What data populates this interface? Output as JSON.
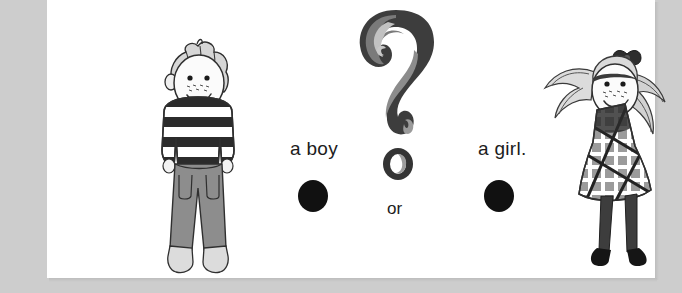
{
  "page": {
    "background_color": "#cdcdcd",
    "card_color": "#ffffff",
    "kind": "worksheet-question-illustration"
  },
  "question": {
    "mark_glyph": "?",
    "mark_label": "stylized-question-mark",
    "mark_colors": {
      "dark": "#3a3a3a",
      "mid": "#6e6e6e",
      "light": "#9a9a9a",
      "highlight": "#cfcfcf"
    }
  },
  "choices": [
    {
      "id": "boy",
      "label": "a boy",
      "bubble": "answer-bubble",
      "bubble_color": "#111111",
      "illustration": "boy-figure"
    },
    {
      "id": "girl",
      "label": "a girl.",
      "bubble": "answer-bubble",
      "bubble_color": "#111111",
      "illustration": "girl-figure"
    }
  ],
  "connector": {
    "label": "or"
  },
  "illustrations": {
    "boy": {
      "name": "boy-figure",
      "hair": "spiky-short-hair",
      "shirt": "horizontal-striped-sweater",
      "shirt_colors": [
        "#2b2b2b",
        "#ffffff"
      ],
      "pants": "long-gray-pants",
      "pants_color": "#8d8d8d",
      "shoes": "light-gray-shoes",
      "shoes_color": "#d8d8d8",
      "face": "freckled-smiling-face"
    },
    "girl": {
      "name": "girl-figure",
      "hair": "two-long-pigtails",
      "hair_bow": "dark-hair-bow",
      "dress": "plaid-checkered-dress",
      "dress_colors": [
        "#9b9b9b",
        "#ffffff",
        "#2b2b2b"
      ],
      "legs": "dark-tights",
      "legs_color": "#3d3d3d",
      "shoes": "dark-shoes",
      "shoes_color": "#151515",
      "face": "freckled-smiling-face"
    }
  }
}
